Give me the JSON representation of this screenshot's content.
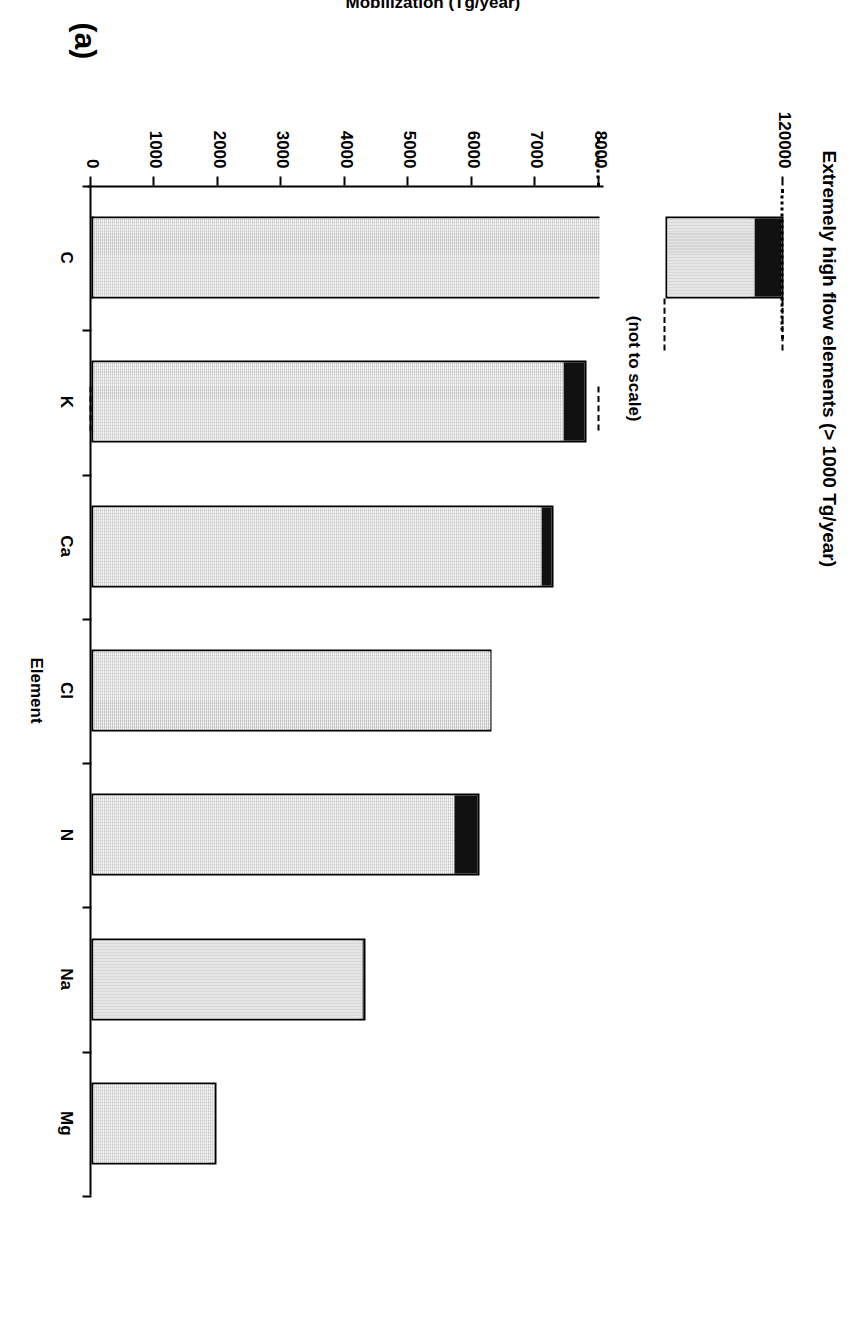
{
  "panel": {
    "label": "(a)"
  },
  "chart_data": {
    "type": "bar",
    "title": "Extremely high flow elements (> 1000 Tg/year)",
    "xlabel": "Element",
    "ylabel": "Mobilization (Tg/year)",
    "categories": [
      "C",
      "K",
      "Ca",
      "Cl",
      "N",
      "Na",
      "Mg"
    ],
    "series": [
      {
        "name": "natural",
        "values": [
          114000,
          7400,
          7050,
          6250,
          5680,
          4240,
          1900
        ]
      },
      {
        "name": "anthropogenic",
        "values": [
          6000,
          400,
          230,
          50,
          430,
          70,
          70
        ]
      }
    ],
    "values": [
      120000,
      7800,
      7280,
      6300,
      6110,
      4310,
      1970
    ],
    "ylim": [
      0,
      8000
    ],
    "yticks": [
      0,
      1000,
      2000,
      3000,
      4000,
      5000,
      6000,
      7000,
      8000
    ],
    "ytick_labels": [
      "0",
      "1000",
      "2000",
      "3000",
      "4000",
      "5000",
      "6000",
      "7000",
      "8000"
    ],
    "broken_axis": {
      "note": "(not to scale)",
      "inset_tick_label": "120000",
      "inset_value": 120000,
      "inset_black_fraction": 0.26
    },
    "grid": false,
    "legend": null,
    "colors": {
      "gray_fill": "#d9d9d9",
      "black_fill": "#111111",
      "outline": "#000000"
    },
    "orientation": "vertical-bars-rotated-90"
  }
}
